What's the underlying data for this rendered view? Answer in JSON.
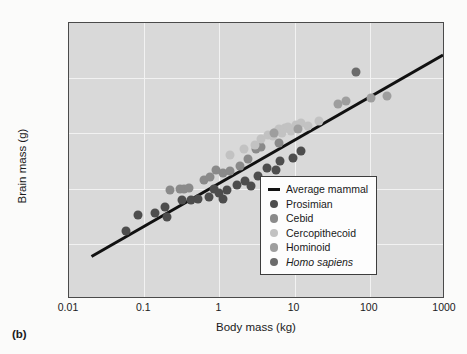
{
  "panel_label": "(b)",
  "chart_data": {
    "type": "scatter",
    "title": "",
    "xlabel": "Body mass (kg)",
    "ylabel": "Brain mass (g)",
    "xscale": "log",
    "yscale": "log",
    "xlim": [
      0.01,
      1000
    ],
    "ylim": [
      0.1,
      10000
    ],
    "xticks": [
      "0.01",
      "0.1",
      "1",
      "10",
      "100",
      "1000"
    ],
    "xtick_values": [
      0.01,
      0.1,
      1,
      10,
      100,
      1000
    ],
    "yticks": [
      "0.1",
      "1",
      "10",
      "100",
      "1,000",
      "10,000"
    ],
    "ytick_values": [
      0.1,
      1,
      10,
      100,
      1000,
      10000
    ],
    "grid": true,
    "legend_position": "lower right",
    "plot_background": "#d9d9d9",
    "gridline_color": "#f2f2f2",
    "trendline": {
      "name": "Average mammal",
      "color": "#111111",
      "x_start": 0.02,
      "y_start": 0.55,
      "x_end": 1000,
      "y_end": 2600
    },
    "series": [
      {
        "name": "Prosimian",
        "color": "#4d4d4d",
        "points": [
          [
            0.058,
            1.7
          ],
          [
            0.082,
            3.3
          ],
          [
            0.14,
            3.6
          ],
          [
            0.19,
            4.6
          ],
          [
            0.2,
            3.1
          ],
          [
            0.32,
            6.2
          ],
          [
            0.42,
            6.3
          ],
          [
            0.52,
            6.4
          ],
          [
            0.72,
            7.1
          ],
          [
            0.85,
            9.8
          ],
          [
            1.0,
            8.2
          ],
          [
            1.1,
            6.4
          ],
          [
            1.25,
            9.3
          ],
          [
            1.7,
            11.5
          ],
          [
            2.2,
            14.0
          ],
          [
            2.6,
            11.0
          ],
          [
            3.3,
            17.0
          ],
          [
            4.3,
            24.0
          ],
          [
            5.6,
            22.0
          ],
          [
            6.4,
            32.0
          ],
          [
            9.5,
            36.0
          ],
          [
            12.0,
            48.0
          ]
        ]
      },
      {
        "name": "Cebid",
        "color": "#8a8a8a",
        "points": [
          [
            0.22,
            9.5
          ],
          [
            0.3,
            9.8
          ],
          [
            0.34,
            10.0
          ],
          [
            0.4,
            10.2
          ],
          [
            0.62,
            14.5
          ],
          [
            0.75,
            16.0
          ],
          [
            0.9,
            22.0
          ],
          [
            1.1,
            19.0
          ],
          [
            1.4,
            21.0
          ],
          [
            1.9,
            26.0
          ],
          [
            2.4,
            34.0
          ],
          [
            3.1,
            52.0
          ],
          [
            3.6,
            57.0
          ],
          [
            6.2,
            68.0
          ]
        ]
      },
      {
        "name": "Cercopithecoid",
        "color": "#c2c2c2",
        "points": [
          [
            1.4,
            41.0
          ],
          [
            2.1,
            52.0
          ],
          [
            3.0,
            62.0
          ],
          [
            3.6,
            78.0
          ],
          [
            4.4,
            95.0
          ],
          [
            5.1,
            88.0
          ],
          [
            5.6,
            108.0
          ],
          [
            6.2,
            118.0
          ],
          [
            6.8,
            102.0
          ],
          [
            7.4,
            126.0
          ],
          [
            8.2,
            132.0
          ],
          [
            9.0,
            112.0
          ],
          [
            10.5,
            142.0
          ],
          [
            12.0,
            155.0
          ],
          [
            15.0,
            138.0
          ],
          [
            21.0,
            168.0
          ]
        ]
      },
      {
        "name": "Hominoid",
        "color": "#9e9e9e",
        "points": [
          [
            5.4,
            102.0
          ],
          [
            11.0,
            118.0
          ],
          [
            38.0,
            345.0
          ],
          [
            48.0,
            385.0
          ],
          [
            105.0,
            430.0
          ],
          [
            170.0,
            480.0
          ]
        ]
      },
      {
        "name": "Homo sapiens",
        "color": "#6b6b6b",
        "italic": true,
        "points": [
          [
            65.0,
            1300.0
          ]
        ]
      }
    ]
  },
  "legend": {
    "entries": [
      {
        "label": "Average mammal",
        "type": "line",
        "color": "#111111"
      },
      {
        "label": "Prosimian",
        "type": "dot",
        "color": "#4d4d4d"
      },
      {
        "label": "Cebid",
        "type": "dot",
        "color": "#8a8a8a"
      },
      {
        "label": "Cercopithecoid",
        "type": "dot",
        "color": "#c2c2c2"
      },
      {
        "label": "Hominoid",
        "type": "dot",
        "color": "#9e9e9e"
      },
      {
        "label": "Homo sapiens",
        "type": "dot",
        "color": "#6b6b6b",
        "italic": true
      }
    ]
  }
}
